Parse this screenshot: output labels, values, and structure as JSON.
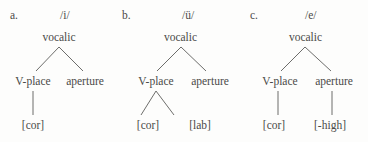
{
  "figure": {
    "background_color": "#fdfdfc",
    "text_color": "#4a4a48",
    "line_color": "#6d6d6b"
  },
  "trees": [
    {
      "letter": "a.",
      "phoneme": "/i/",
      "root": "vocalic",
      "mid_left": "V-place",
      "mid_right": "aperture",
      "leaf_1": "[cor]",
      "leaf_2": ""
    },
    {
      "letter": "b.",
      "phoneme": "/ü/",
      "root": "vocalic",
      "mid_left": "V-place",
      "mid_right": "aperture",
      "leaf_1": "[cor]",
      "leaf_2": "[lab]"
    },
    {
      "letter": "c.",
      "phoneme": "/e/",
      "root": "vocalic",
      "mid_left": "V-place",
      "mid_right": "aperture",
      "leaf_1": "[cor]",
      "leaf_2": "[-high]"
    }
  ]
}
